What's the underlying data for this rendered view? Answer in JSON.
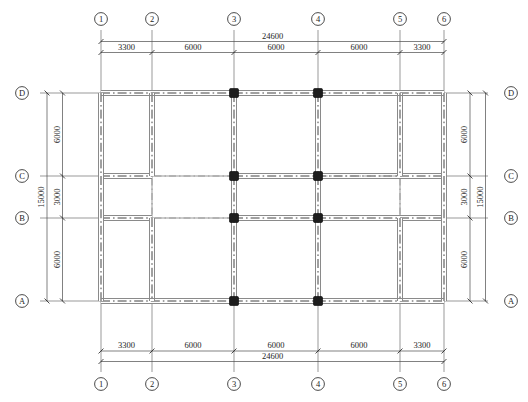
{
  "drawing": {
    "type": "structural-framing-plan",
    "title": "",
    "units": "mm",
    "overall_width": "24600",
    "overall_height": "15000"
  },
  "grid": {
    "vertical_labels": [
      "1",
      "2",
      "3",
      "4",
      "5",
      "6"
    ],
    "horizontal_labels": [
      "D",
      "C",
      "B",
      "A"
    ],
    "vertical_positions_px": [
      101,
      152,
      234,
      318,
      400,
      444
    ],
    "horizontal_positions_px": [
      93,
      176,
      218,
      301
    ]
  },
  "dimensions": {
    "top": {
      "total_label": "24600",
      "segments": [
        "3300",
        "6000",
        "6000",
        "6000",
        "3300"
      ]
    },
    "bottom": {
      "total_label": "24600",
      "segments": [
        "3300",
        "6000",
        "6000",
        "6000",
        "3300"
      ]
    },
    "left": {
      "total_label": "15000",
      "segments": [
        "6000",
        "3000",
        "6000"
      ]
    },
    "right": {
      "total_label": "15000",
      "segments": [
        "6000",
        "3000",
        "6000"
      ]
    }
  },
  "columns": {
    "fill_color": "#1d1d1d",
    "size_px": 9,
    "locations": [
      {
        "x_axis": "3",
        "y_axis": "D"
      },
      {
        "x_axis": "4",
        "y_axis": "D"
      },
      {
        "x_axis": "3",
        "y_axis": "C"
      },
      {
        "x_axis": "4",
        "y_axis": "C"
      },
      {
        "x_axis": "3",
        "y_axis": "B"
      },
      {
        "x_axis": "4",
        "y_axis": "B"
      },
      {
        "x_axis": "3",
        "y_axis": "A"
      },
      {
        "x_axis": "4",
        "y_axis": "A"
      }
    ]
  },
  "beams": {
    "line_color": "#6f6f6f",
    "edge_color": "#2a2a2a",
    "band_width_px": 5
  },
  "colors": {
    "ink": "#1d1d1d",
    "grid_line": "#555555",
    "beam_band": "#8a8a8a",
    "column": "#1d1d1d",
    "dim_line": "#4a4a4a"
  }
}
